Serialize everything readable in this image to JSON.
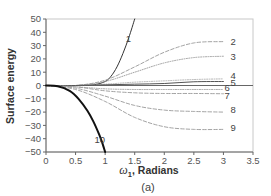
{
  "chart_data": {
    "type": "line",
    "title": "",
    "panel_caption": "(a)",
    "xlabel": "ω1, Radians",
    "xlabel_parts": {
      "symbol": "ω",
      "subscript": "1",
      "rest": ", Radians"
    },
    "ylabel": "Surface energy",
    "xlim": [
      0,
      3.5
    ],
    "ylim": [
      -50,
      50
    ],
    "x_ticks": [
      0,
      0.5,
      1,
      1.5,
      2,
      2.5,
      3,
      3.5
    ],
    "x_tick_labels": [
      "0",
      "0.5",
      "1",
      "1.5",
      "2",
      "2.5",
      "3",
      "3.5"
    ],
    "y_ticks": [
      50,
      40,
      30,
      20,
      10,
      0,
      -10,
      -20,
      -30,
      -40,
      -50
    ],
    "y_tick_labels": [
      "50",
      "40",
      "30",
      "20",
      "10",
      "0",
      "−10",
      "−20",
      "−30",
      "−40",
      "−50"
    ],
    "grid": false,
    "legend": "inline curve labels 1–10",
    "series": [
      {
        "name": "1",
        "style": "solid",
        "width": 1.0,
        "color": "#333333",
        "x": [
          0,
          0.5,
          0.8,
          1.0,
          1.1,
          1.2,
          1.3,
          1.4,
          1.5
        ],
        "y": [
          0,
          0,
          0.5,
          3,
          7,
          14,
          24,
          36,
          50
        ],
        "label_pos": [
          1.35,
          35
        ]
      },
      {
        "name": "2",
        "style": "dashed",
        "width": 0.9,
        "color": "#999999",
        "x": [
          0,
          0.5,
          1.0,
          1.5,
          2.0,
          2.5,
          3.0
        ],
        "y": [
          0,
          0,
          4,
          14,
          25,
          32,
          33
        ],
        "label_pos": [
          3.12,
          33
        ]
      },
      {
        "name": "3",
        "style": "dotted",
        "width": 0.9,
        "color": "#999999",
        "x": [
          0,
          0.5,
          1.0,
          1.5,
          2.0,
          2.5,
          3.0
        ],
        "y": [
          0,
          0,
          3,
          10,
          17,
          21,
          22
        ],
        "label_pos": [
          3.12,
          22
        ]
      },
      {
        "name": "4",
        "style": "dotted",
        "width": 0.9,
        "color": "#aaaaaa",
        "x": [
          0,
          0.5,
          1.0,
          1.5,
          2.0,
          2.5,
          3.0
        ],
        "y": [
          0,
          0,
          1,
          2.5,
          3.5,
          4.5,
          5
        ],
        "label_pos": [
          3.12,
          7
        ]
      },
      {
        "name": "5",
        "style": "solid",
        "width": 1.0,
        "color": "#555555",
        "x": [
          0,
          0.5,
          1.0,
          1.5,
          2.0,
          2.5,
          3.0
        ],
        "y": [
          0,
          0,
          0.5,
          1,
          1.5,
          2.8,
          3
        ],
        "label_pos": [
          3.12,
          2
        ]
      },
      {
        "name": "6",
        "style": "dotted",
        "width": 0.9,
        "color": "#999999",
        "x": [
          0,
          0.5,
          1.0,
          1.5,
          2.0,
          2.5,
          3.0
        ],
        "y": [
          0,
          -1,
          -2.5,
          -3,
          -3,
          -3,
          -3
        ],
        "label_pos": [
          3.02,
          -1.5
        ]
      },
      {
        "name": "7",
        "style": "dashed",
        "width": 0.9,
        "color": "#999999",
        "x": [
          0,
          0.5,
          1.0,
          1.5,
          2.0,
          2.5,
          3.0
        ],
        "y": [
          0,
          -1,
          -4,
          -5.5,
          -6,
          -6,
          -6.2
        ],
        "label_pos": [
          3.02,
          -8
        ]
      },
      {
        "name": "8",
        "style": "dashed",
        "width": 0.9,
        "color": "#999999",
        "x": [
          0,
          0.5,
          1.0,
          1.5,
          2.0,
          2.5,
          3.0
        ],
        "y": [
          0,
          -2,
          -8,
          -15,
          -18.5,
          -19.5,
          -20
        ],
        "label_pos": [
          3.12,
          -18
        ]
      },
      {
        "name": "9",
        "style": "dashed",
        "width": 0.9,
        "color": "#999999",
        "x": [
          0,
          0.5,
          1.0,
          1.5,
          2.0,
          2.5,
          3.0
        ],
        "y": [
          0,
          -3,
          -12,
          -24,
          -31,
          -33,
          -33
        ],
        "label_pos": [
          3.12,
          -32
        ]
      },
      {
        "name": "10",
        "style": "solid",
        "width": 2.0,
        "color": "#111111",
        "x": [
          0,
          0.2,
          0.4,
          0.55,
          0.7,
          0.8,
          0.9,
          0.95,
          1.0
        ],
        "y": [
          0,
          -0.5,
          -4,
          -10,
          -19,
          -27,
          -37,
          -43,
          -50
        ],
        "label_pos": [
          0.82,
          -41
        ]
      }
    ]
  }
}
